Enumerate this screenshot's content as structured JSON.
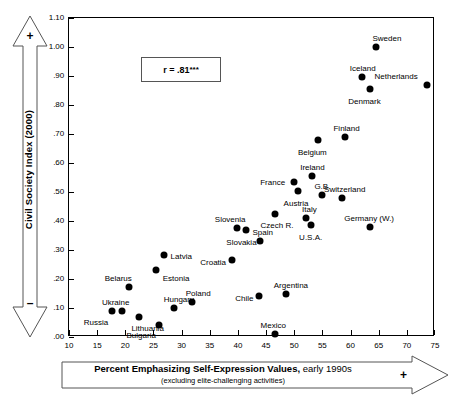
{
  "chart_data": {
    "type": "scatter",
    "title": "",
    "xlabel": "Percent Emphasizing Self-Expression Values, early 1990s",
    "xlabel_bold": "Percent Emphasizing Self-Expression Values,",
    "xlabel_regular": " early 1990s",
    "xsublabel": "(excluding elite-challenging activities)",
    "ylabel": "Civil Society Index (2000)",
    "xlim": [
      10,
      75
    ],
    "ylim": [
      0.0,
      1.1
    ],
    "xticks": [
      10,
      15,
      20,
      25,
      30,
      35,
      40,
      45,
      50,
      55,
      60,
      65,
      70,
      75
    ],
    "xtick_labels": [
      "10",
      "15",
      "20",
      "25",
      "30",
      "35",
      "40",
      "45",
      "50",
      "55",
      "60",
      "65",
      "70",
      "75"
    ],
    "yticks": [
      0.0,
      0.1,
      0.2,
      0.3,
      0.4,
      0.5,
      0.6,
      0.7,
      0.8,
      0.9,
      1.0,
      1.1
    ],
    "ytick_labels": [
      ".00",
      ".10",
      ".20",
      ".30",
      ".40",
      ".50",
      ".60",
      ".70",
      ".80",
      ".90",
      "1.00",
      "1.10"
    ],
    "grid": false,
    "legend": "none",
    "annotation": "r = .81***",
    "annotation_value": "r = .81",
    "annotation_stars": "***",
    "axis_sign_positive": "+",
    "axis_sign_negative": "–",
    "marker": "filled-circle",
    "marker_color": "#000000",
    "points": [
      {
        "label": "Russia",
        "x": 17.6,
        "y": 0.09,
        "lx": -28,
        "ly": 8
      },
      {
        "label": "Ukraine",
        "x": 19.4,
        "y": 0.09,
        "lx": -20,
        "ly": -12
      },
      {
        "label": "Belarus",
        "x": 20.6,
        "y": 0.172,
        "lx": -24,
        "ly": -12
      },
      {
        "label": "Lithuania",
        "x": 22.5,
        "y": 0.07,
        "lx": -8,
        "ly": 8
      },
      {
        "label": "Bulgaria",
        "x": 25.9,
        "y": 0.042,
        "lx": -32,
        "ly": 7
      },
      {
        "label": "Estonia",
        "x": 25.4,
        "y": 0.23,
        "lx": 7,
        "ly": 5
      },
      {
        "label": "Latvia",
        "x": 26.8,
        "y": 0.282,
        "lx": 7,
        "ly": -2
      },
      {
        "label": "Hungary",
        "x": 28.6,
        "y": 0.101,
        "lx": -10,
        "ly": -12
      },
      {
        "label": "Poland",
        "x": 31.8,
        "y": 0.12,
        "lx": -6,
        "ly": -12
      },
      {
        "label": "Croatia",
        "x": 39.0,
        "y": 0.265,
        "lx": -32,
        "ly": -1
      },
      {
        "label": "Slovenia",
        "x": 39.8,
        "y": 0.375,
        "lx": -22,
        "ly": -12
      },
      {
        "label": "Slovakia",
        "x": 41.5,
        "y": 0.37,
        "lx": -20,
        "ly": 9
      },
      {
        "label": "Spain",
        "x": 44.0,
        "y": 0.33,
        "lx": -8,
        "ly": -12
      },
      {
        "label": "Chile",
        "x": 43.8,
        "y": 0.142,
        "lx": -24,
        "ly": -1
      },
      {
        "label": "Mexico",
        "x": 46.5,
        "y": 0.01,
        "lx": -14,
        "ly": -12
      },
      {
        "label": "Czech R.",
        "x": 46.5,
        "y": 0.425,
        "lx": -14,
        "ly": 8
      },
      {
        "label": "Argentina",
        "x": 48.5,
        "y": 0.15,
        "lx": -12,
        "ly": -12
      },
      {
        "label": "France",
        "x": 50.0,
        "y": 0.535,
        "lx": -34,
        "ly": -3
      },
      {
        "label": "Austria",
        "x": 50.6,
        "y": 0.505,
        "lx": -14,
        "ly": 9
      },
      {
        "label": "Italy",
        "x": 52.1,
        "y": 0.41,
        "lx": -4,
        "ly": -12
      },
      {
        "label": "U.S.A.",
        "x": 53.0,
        "y": 0.385,
        "lx": -12,
        "ly": 9
      },
      {
        "label": "Ireland",
        "x": 53.2,
        "y": 0.555,
        "lx": -12,
        "ly": -12
      },
      {
        "label": "Belgium",
        "x": 54.2,
        "y": 0.68,
        "lx": -20,
        "ly": 9
      },
      {
        "label": "G.B.",
        "x": 55.0,
        "y": 0.49,
        "lx": -8,
        "ly": -12
      },
      {
        "label": "Switzerland",
        "x": 58.5,
        "y": 0.48,
        "lx": -18,
        "ly": -12
      },
      {
        "label": "Finland",
        "x": 59.1,
        "y": 0.69,
        "lx": -12,
        "ly": -12
      },
      {
        "label": "Germany (W.)",
        "x": 63.5,
        "y": 0.38,
        "lx": -26,
        "ly": -12
      },
      {
        "label": "Denmark",
        "x": 63.5,
        "y": 0.855,
        "lx": -22,
        "ly": 9
      },
      {
        "label": "Iceland",
        "x": 62.0,
        "y": 0.895,
        "lx": -12,
        "ly": -12
      },
      {
        "label": "Sweden",
        "x": 64.6,
        "y": 1.0,
        "lx": -4,
        "ly": -12
      },
      {
        "label": "Netherlands",
        "x": 73.5,
        "y": 0.87,
        "lx": -52,
        "ly": -12
      }
    ]
  }
}
